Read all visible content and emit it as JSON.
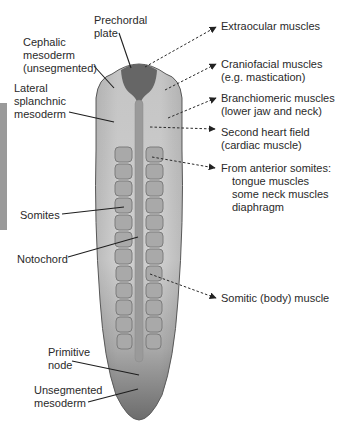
{
  "figure": {
    "colors": {
      "embryo_light": "#c8c8c8",
      "embryo_dark": "#6e6e6e",
      "prechordal": "#6a6a6a",
      "somite": "#a8a8a8",
      "somite_border": "#7a7a7a",
      "notochord": "#9c9c9c",
      "outline": "#555555",
      "side_bar": "#9a9a9a"
    },
    "somite_rows": 12
  },
  "left_labels": {
    "prechordal": "Prechordal\nplate",
    "cephalic": "Cephalic\nmesoderm\n(unsegmented)",
    "lateral": "Lateral\nsplanchnic\nmesoderm",
    "somites": "Somites",
    "notochord": "Notochord",
    "primitive_node": "Primitive\nnode",
    "unsegmented": "Unsegmented\nmesoderm"
  },
  "right_labels": {
    "extraocular": "Extraocular muscles",
    "craniofacial": "Craniofacial muscles\n(e.g. mastication)",
    "branchiomeric": "Branchiomeric muscles\n(lower jaw and neck)",
    "second_heart": "Second heart field\n(cardiac muscle)",
    "anterior_somites_title": "From anterior somites:",
    "anterior_somites_list": "tongue muscles\nsome neck muscles\ndiaphragm",
    "somitic": "Somitic (body) muscle"
  }
}
